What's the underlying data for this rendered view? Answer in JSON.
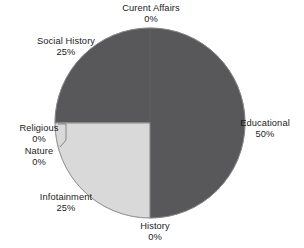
{
  "chart_data": {
    "type": "pie",
    "title": "",
    "subtitle": "",
    "xlabel": "",
    "ylabel": "",
    "grid": false,
    "legend": "none",
    "labels_show_percent": true,
    "start_angle_deg": 0,
    "direction": "clockwise",
    "categories": [
      "Educational",
      "History",
      "Infotainment",
      "Nature",
      "Religious",
      "Social History",
      "Curent Affairs"
    ],
    "values": [
      50,
      0,
      25,
      0,
      0,
      25,
      0
    ],
    "slices": [
      {
        "label": "Educational",
        "percent": 50,
        "percent_text": "50%",
        "color": "#58585a",
        "start_deg": 0,
        "end_deg": 180,
        "callout": false
      },
      {
        "label": "History",
        "percent": 0,
        "percent_text": "0%",
        "color": "#58585a",
        "start_deg": 180,
        "end_deg": 180,
        "callout": false
      },
      {
        "label": "Infotainment",
        "percent": 25,
        "percent_text": "25%",
        "color": "#d9d9d9",
        "start_deg": 180,
        "end_deg": 270,
        "callout": false
      },
      {
        "label": "Nature",
        "percent": 0,
        "percent_text": "0%",
        "color": "#d9d9d9",
        "start_deg": 270,
        "end_deg": 270,
        "callout": true
      },
      {
        "label": "Religious",
        "percent": 0,
        "percent_text": "0%",
        "color": "#d9d9d9",
        "start_deg": 270,
        "end_deg": 270,
        "callout": true
      },
      {
        "label": "Social History",
        "percent": 25,
        "percent_text": "25%",
        "color": "#58585a",
        "start_deg": 270,
        "end_deg": 360,
        "callout": false
      },
      {
        "label": "Curent Affairs",
        "percent": 0,
        "percent_text": "0%",
        "color": "#58585a",
        "start_deg": 360,
        "end_deg": 360,
        "callout": false
      }
    ],
    "colors": {
      "dark_wedge": "#58585a",
      "light_wedge": "#d9d9d9",
      "background": "#ffffff",
      "outline": "#8c8c8c",
      "text": "#1c1c1c",
      "leader_line": "#6e6e6e"
    },
    "geometry": {
      "center_x": 150,
      "center_y": 123,
      "radius": 95
    }
  }
}
